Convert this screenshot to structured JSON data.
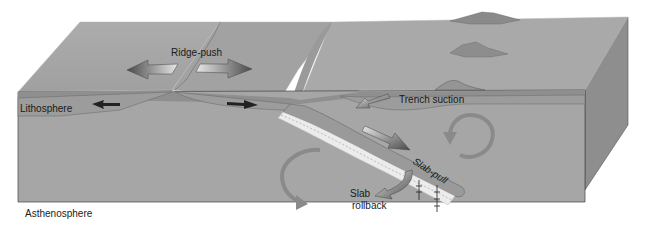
{
  "diagram": {
    "colors": {
      "background": "#ffffff",
      "top_surface": "#a4a4a4",
      "top_surface_right": "#a9a9a9",
      "front_face": "#a6a6a6",
      "side_face": "#8e8e8e",
      "lithosphere_band": "#9c9c9c",
      "lithosphere_strip": "#8f8f8f",
      "slab": "#9a9a9a",
      "slab_stripes": "#ececec",
      "convection_arrow": "#8a8a8a",
      "force_arrow_dark": "#4a4a4a",
      "force_arrow_light": "#e8e8e8",
      "text": "#1a1a1a"
    },
    "labels": {
      "ridge_push": "Ridge-push",
      "lithosphere": "Lithosphere",
      "trench_suction": "Trench suction",
      "slab_pull": "Slab-pull",
      "slab_rollback_line1": "Slab",
      "slab_rollback_line2": "rollback",
      "asthenosphere": "Asthenosphere"
    },
    "features": [
      {
        "name": "mid-ocean-ridge",
        "description": "Spreading ridge at left-center of the block"
      },
      {
        "name": "subduction-trench",
        "description": "Trench where slab descends"
      },
      {
        "name": "volcanic-islands",
        "description": "Two volcanic peaks on the overriding plate"
      },
      {
        "name": "convection-cells",
        "description": "Two circular arrows in asthenosphere"
      }
    ]
  }
}
